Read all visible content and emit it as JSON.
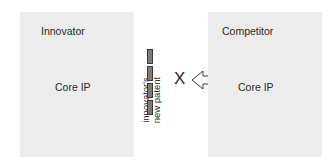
{
  "diagram": {
    "innovator": {
      "title": "Innovator",
      "core_label": "Core IP"
    },
    "competitor": {
      "title": "Competitor",
      "core_label": "Core IP"
    },
    "patent_barrier": {
      "label_line1": "innovator's",
      "label_line2": "new patent",
      "bar_count": 4
    },
    "blocked_marker": "X",
    "arrow": {
      "direction": "left",
      "icon": "hollow-arrow-left-icon"
    },
    "colors": {
      "box_fill": "#ececec",
      "bar_fill": "#7d7d7d",
      "bar_stroke": "#3a3a3a",
      "text": "#2a2a2a"
    }
  }
}
